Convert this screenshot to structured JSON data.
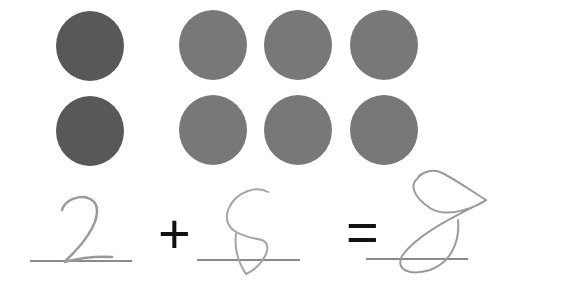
{
  "worksheet": {
    "groups": [
      {
        "name": "left-group",
        "count": 2,
        "color": "#585858"
      },
      {
        "name": "right-group",
        "count": 6,
        "color": "#787878"
      }
    ],
    "equation": {
      "addend1": "2",
      "operator": "+",
      "addend2": "6",
      "equals": "=",
      "sum": "8"
    }
  }
}
